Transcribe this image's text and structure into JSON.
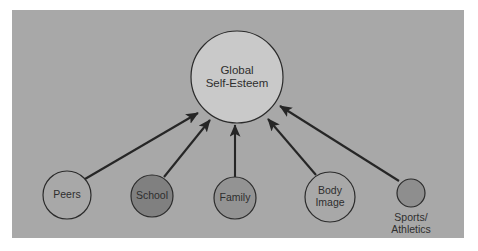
{
  "figure": {
    "type": "influence-diagram",
    "panel": {
      "background_color": "#a8a8a8",
      "outer_background_color": "#ffffff",
      "x": 12,
      "y": 10,
      "width": 452,
      "height": 228
    },
    "stroke_color": "#2b2b2b",
    "central_node": {
      "id": "global-self-esteem",
      "lines": [
        "Global",
        "Self-Esteem"
      ],
      "label": "Global Self-Esteem",
      "cx": 237,
      "cy": 77,
      "r": 46,
      "fill": "#c9c9c9",
      "label_position": "inside"
    },
    "source_nodes": [
      {
        "id": "peers",
        "lines": [
          "Peers"
        ],
        "label": "Peers",
        "cx": 67,
        "cy": 195,
        "r": 24,
        "fill": "#a8a8a8",
        "label_position": "inside"
      },
      {
        "id": "school",
        "lines": [
          "School"
        ],
        "label": "School",
        "cx": 152,
        "cy": 196,
        "r": 21,
        "fill": "#808080",
        "label_position": "inside"
      },
      {
        "id": "family",
        "lines": [
          "Family"
        ],
        "label": "Family",
        "cx": 235,
        "cy": 198,
        "r": 21,
        "fill": "#939393",
        "label_position": "inside"
      },
      {
        "id": "body-image",
        "lines": [
          "Body",
          "Image"
        ],
        "label": "Body Image",
        "cx": 330,
        "cy": 197,
        "r": 25,
        "fill": "#a8a8a8",
        "label_position": "inside"
      },
      {
        "id": "sports-athletics",
        "lines": [
          "Sports/",
          "Athletics"
        ],
        "label": "Sports/Athletics",
        "cx": 411,
        "cy": 193,
        "r": 14,
        "fill": "#8e8e8e",
        "label_position": "below"
      }
    ],
    "arrows": [
      {
        "id": "arrow-peers-to-global",
        "from": "peers",
        "to": "global-self-esteem",
        "x1": 85,
        "y1": 179,
        "x2": 198,
        "y2": 113
      },
      {
        "id": "arrow-school-to-global",
        "from": "school",
        "to": "global-self-esteem",
        "x1": 164,
        "y1": 177,
        "x2": 210,
        "y2": 120
      },
      {
        "id": "arrow-family-to-global",
        "from": "family",
        "to": "global-self-esteem",
        "x1": 235,
        "y1": 177,
        "x2": 235,
        "y2": 125
      },
      {
        "id": "arrow-body-image-to-global",
        "from": "body-image",
        "to": "global-self-esteem",
        "x1": 316,
        "y1": 175,
        "x2": 268,
        "y2": 119
      },
      {
        "id": "arrow-sports-to-global",
        "from": "sports-athletics",
        "to": "global-self-esteem",
        "x1": 399,
        "y1": 181,
        "x2": 280,
        "y2": 106
      }
    ]
  }
}
